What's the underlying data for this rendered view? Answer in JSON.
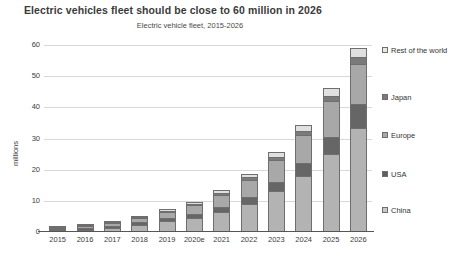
{
  "chart_data": {
    "type": "bar",
    "subtype": "stacked-bar",
    "title": "Electric vehicles fleet should be close to 60 million in 2026",
    "subtitle": "Electric vehicle fleet, 2015-2026",
    "xlabel": "",
    "ylabel": "millions",
    "ylim": [
      0,
      60
    ],
    "yticks": [
      0,
      10,
      20,
      30,
      40,
      50,
      60
    ],
    "ytick_labels": [
      "0",
      "10",
      "20",
      "30",
      "40",
      "50",
      "60"
    ],
    "grid": true,
    "legend_position": "right",
    "categories": [
      "2015",
      "2016",
      "2017",
      "2018",
      "2019",
      "2020e",
      "2021",
      "2022",
      "2023",
      "2024",
      "2025",
      "2026"
    ],
    "series": [
      {
        "name": "China",
        "color": "#b3b3b3",
        "values": [
          0.4,
          0.8,
          1.4,
          2.4,
          3.5,
          4.6,
          6.4,
          9.0,
          13.0,
          18.0,
          25.0,
          33.5
        ]
      },
      {
        "name": "USA",
        "color": "#666666",
        "values": [
          0.4,
          0.5,
          0.6,
          0.8,
          1.0,
          1.2,
          1.6,
          2.2,
          3.0,
          4.0,
          5.5,
          7.5
        ]
      },
      {
        "name": "Europe",
        "color": "#a8a8a8",
        "values": [
          0.3,
          0.5,
          0.9,
          1.4,
          2.0,
          2.8,
          4.0,
          5.5,
          7.0,
          9.0,
          11.5,
          13.0
        ]
      },
      {
        "name": "Japan",
        "color": "#7a7a7a",
        "values": [
          0.1,
          0.15,
          0.2,
          0.3,
          0.4,
          0.5,
          0.6,
          0.8,
          1.0,
          1.3,
          1.6,
          2.0
        ]
      },
      {
        "name": "Rest of the world",
        "color": "#e0e0e0",
        "values": [
          0.05,
          0.1,
          0.15,
          0.3,
          0.4,
          0.6,
          0.8,
          1.2,
          1.6,
          2.0,
          2.6,
          3.2
        ]
      }
    ],
    "totals": [
      1.25,
      2.05,
      3.25,
      5.2,
      7.3,
      9.7,
      13.4,
      18.7,
      25.6,
      34.3,
      46.2,
      59.2
    ]
  },
  "legend": {
    "entries": [
      {
        "label": "Rest of the world",
        "color": "#e8e8e8"
      },
      {
        "label": "Japan",
        "color": "#7a7a7a"
      },
      {
        "label": "Europe",
        "color": "#a8a8a8"
      },
      {
        "label": "USA",
        "color": "#5e5e5e"
      },
      {
        "label": "China",
        "color": "#c9c9c9"
      }
    ]
  }
}
